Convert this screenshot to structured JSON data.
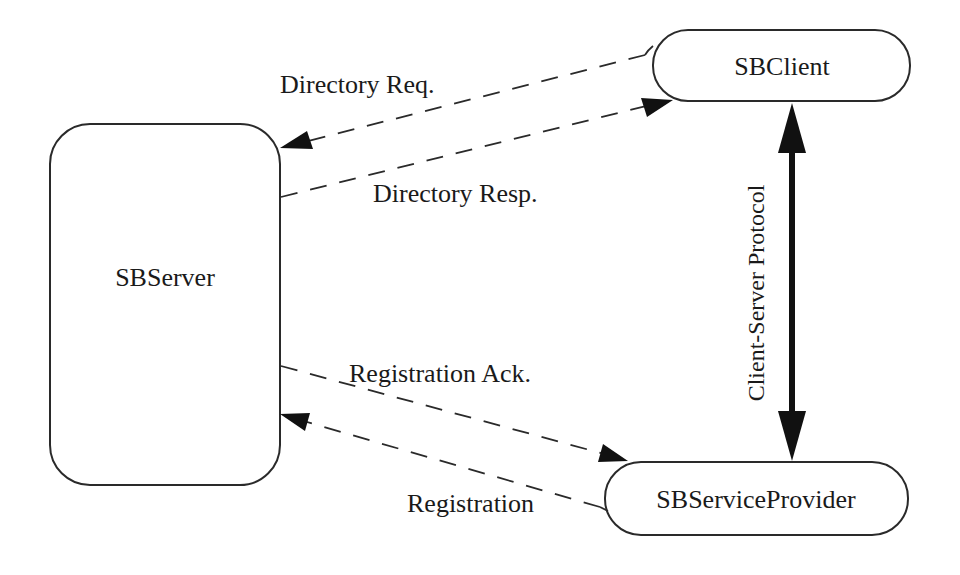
{
  "diagram": {
    "nodes": {
      "server": {
        "label": "SBServer",
        "shape": "rounded-rectangle"
      },
      "client": {
        "label": "SBClient",
        "shape": "pill"
      },
      "provider": {
        "label": "SBServiceProvider",
        "shape": "pill"
      }
    },
    "edges": {
      "directory_request": {
        "label": "Directory Req.",
        "from": "SBClient",
        "to": "SBServer",
        "style": "dashed"
      },
      "directory_response": {
        "label": "Directory Resp.",
        "from": "SBServer",
        "to": "SBClient",
        "style": "dashed"
      },
      "registration_ack": {
        "label": "Registration Ack.",
        "from": "SBServer",
        "to": "SBServiceProvider",
        "style": "dashed"
      },
      "registration": {
        "label": "Registration",
        "from": "SBServiceProvider",
        "to": "SBServer",
        "style": "dashed"
      },
      "client_server_protocol": {
        "label": "Client-Server Protocol",
        "from": "SBClient",
        "to": "SBServiceProvider",
        "style": "bold-bidirectional"
      }
    },
    "colors": {
      "stroke": "#2a2a2a",
      "arrowhead": "#111111",
      "background": "#ffffff"
    }
  }
}
